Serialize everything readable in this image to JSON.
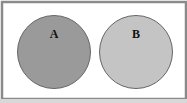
{
  "diagram": {
    "type": "venn",
    "sets": [
      {
        "label": "A",
        "fill": "#9a9a9a",
        "stroke": "#666666"
      },
      {
        "label": "B",
        "fill": "#c4c4c4",
        "stroke": "#666666"
      }
    ],
    "frame": {
      "stroke": "#8a8a8a",
      "fill": "#ffffff"
    }
  }
}
